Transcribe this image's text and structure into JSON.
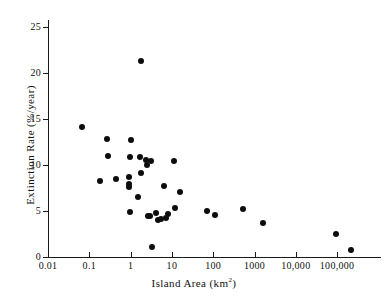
{
  "chart": {
    "type": "scatter",
    "title": "",
    "xlabel_text": "Island Area (km",
    "xlabel_unit": "2",
    "xlabel_close": ")",
    "xlabel_full": "Island Area (km2)",
    "ylabel": "Extinction Rate (%/year)",
    "point_color": "#0d0d0d",
    "axis_color": "#1a1a1a",
    "background": "#ffffff"
  },
  "chart_data": {
    "type": "scatter",
    "title": "",
    "xlabel": "Island Area (km2)",
    "ylabel": "Extinction Rate (%/year)",
    "xscale": "log",
    "yscale": "linear",
    "xlim": [
      0.01,
      300000
    ],
    "ylim": [
      0,
      26.5
    ],
    "grid": false,
    "legend": null,
    "xticks": [
      0.01,
      0.1,
      1,
      10,
      100,
      1000,
      10000,
      100000
    ],
    "xticklabels": [
      "0.01",
      "0.1",
      "1",
      "10",
      "100",
      "1000",
      "10,000",
      "100,000"
    ],
    "yticks": [
      0,
      5,
      10,
      15,
      20,
      25
    ],
    "yticklabels": [
      "0",
      "5",
      "10",
      "15",
      "20",
      "25"
    ],
    "points": [
      {
        "x": 0.065,
        "y": 14.1
      },
      {
        "x": 0.18,
        "y": 8.3
      },
      {
        "x": 0.27,
        "y": 12.8
      },
      {
        "x": 0.28,
        "y": 11.0
      },
      {
        "x": 0.45,
        "y": 8.5
      },
      {
        "x": 0.9,
        "y": 8.7
      },
      {
        "x": 0.92,
        "y": 7.9
      },
      {
        "x": 0.93,
        "y": 7.6
      },
      {
        "x": 0.95,
        "y": 4.85
      },
      {
        "x": 0.97,
        "y": 10.9
      },
      {
        "x": 1.0,
        "y": 12.7
      },
      {
        "x": 1.55,
        "y": 6.5
      },
      {
        "x": 1.7,
        "y": 10.85
      },
      {
        "x": 1.75,
        "y": 21.3
      },
      {
        "x": 1.8,
        "y": 9.1
      },
      {
        "x": 2.3,
        "y": 10.55
      },
      {
        "x": 2.45,
        "y": 9.95
      },
      {
        "x": 2.6,
        "y": 4.45
      },
      {
        "x": 2.9,
        "y": 4.45
      },
      {
        "x": 3.1,
        "y": 10.45
      },
      {
        "x": 3.3,
        "y": 1.1
      },
      {
        "x": 4.2,
        "y": 4.75
      },
      {
        "x": 4.6,
        "y": 4.0
      },
      {
        "x": 5.4,
        "y": 4.1
      },
      {
        "x": 6.3,
        "y": 7.75
      },
      {
        "x": 7.0,
        "y": 4.25
      },
      {
        "x": 8.0,
        "y": 4.7
      },
      {
        "x": 11.5,
        "y": 10.4
      },
      {
        "x": 12.0,
        "y": 5.35
      },
      {
        "x": 16.0,
        "y": 7.1
      },
      {
        "x": 70.0,
        "y": 4.95
      },
      {
        "x": 110.0,
        "y": 4.6
      },
      {
        "x": 520.0,
        "y": 5.2
      },
      {
        "x": 1600.0,
        "y": 3.7
      },
      {
        "x": 95000.0,
        "y": 2.5
      },
      {
        "x": 220000.0,
        "y": 0.8
      }
    ]
  }
}
